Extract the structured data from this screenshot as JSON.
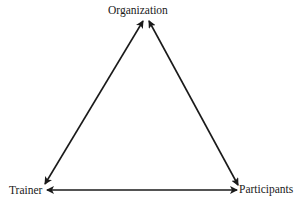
{
  "diagram": {
    "type": "triangle-relationship",
    "nodes": [
      {
        "id": "organization",
        "label": "Organization"
      },
      {
        "id": "trainer",
        "label": "Trainer"
      },
      {
        "id": "participants",
        "label": "Participants"
      }
    ],
    "edges": [
      {
        "from": "organization",
        "to": "trainer",
        "direction": "bidirectional"
      },
      {
        "from": "organization",
        "to": "participants",
        "direction": "bidirectional"
      },
      {
        "from": "trainer",
        "to": "participants",
        "direction": "bidirectional"
      }
    ],
    "colors": {
      "line": "#1a1a1a",
      "background": "#ffffff"
    }
  }
}
